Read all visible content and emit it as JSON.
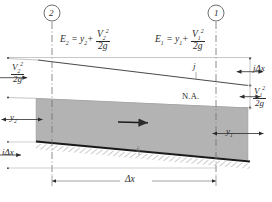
{
  "figure": {
    "type": "open-channel-flow-energy-diagram",
    "sections": {
      "upstream_marker": "2",
      "downstream_marker": "1"
    },
    "equations": {
      "e2": {
        "lhs": "E",
        "lhs_sub": "2",
        "eq": "=",
        "term1": "y",
        "term1_sub": "2",
        "plus": "+",
        "num": "V",
        "num_sub": "2",
        "num_sup": "2",
        "den": "2g"
      },
      "e1": {
        "lhs": "E",
        "lhs_sub": "1",
        "eq": "=",
        "term1": "y",
        "term1_sub": "1",
        "plus": "+",
        "num": "V",
        "num_sub": "1",
        "num_sup": "2",
        "den": "2g"
      }
    },
    "labels": {
      "velocity_head_2": {
        "num": "V",
        "num_sub": "2",
        "num_sup": "2",
        "den": "2g"
      },
      "velocity_head_1": {
        "num": "V",
        "num_sub": "1",
        "num_sup": "2",
        "den": "2g"
      },
      "depth_2": {
        "text": "y",
        "sub": "2"
      },
      "depth_1": {
        "text": "y",
        "sub": "1"
      },
      "energy_slope": "j",
      "energy_drop": "jΔx",
      "bed_slope": "i",
      "bed_drop": "iΔx",
      "reach_length": "Δx",
      "datum": "N.A.",
      "flow_arrow": "flow-direction"
    },
    "colors": {
      "ink": "#2b2b2b",
      "water_fill": "#b3b3b3",
      "bed_line": "#1a1a1a",
      "thin_line": "#8c8c8c",
      "background": "#ffffff"
    }
  }
}
